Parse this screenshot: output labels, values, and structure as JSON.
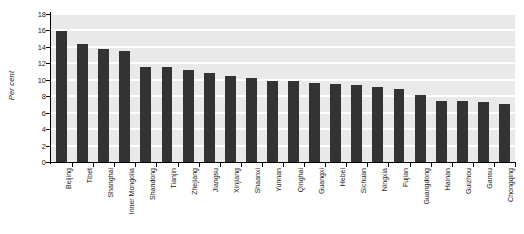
{
  "chart_data": {
    "type": "bar",
    "title": "",
    "xlabel": "",
    "ylabel": "Per cent",
    "ylim": [
      0,
      18
    ],
    "ytick_step": 2,
    "yticks": [
      0,
      2,
      4,
      6,
      8,
      10,
      12,
      14,
      16,
      18
    ],
    "grid": true,
    "legend": "none",
    "bar_color": "#333333",
    "plot_background": "#e9e9e9",
    "gridline_color": "#ffffff",
    "axis_color": "#000000",
    "categories": [
      "Beijing",
      "Tibet",
      "Shanghai",
      "Inner Mongolia",
      "Shandong",
      "Tianjin",
      "Zhejiang",
      "Jiangsu",
      "Xinjiang",
      "Shaanxi",
      "Yunnan",
      "Qinghai",
      "Guangxi",
      "Hebei",
      "Sichuan",
      "Ningxia",
      "Fujian",
      "Guangdong",
      "Hainan",
      "Guizhou",
      "Gansu",
      "Chongqing"
    ],
    "values": [
      15.9,
      14.3,
      13.7,
      13.5,
      11.6,
      11.5,
      11.2,
      10.8,
      10.5,
      10.2,
      9.9,
      9.8,
      9.6,
      9.5,
      9.4,
      9.1,
      8.9,
      8.1,
      7.4,
      7.4,
      7.3,
      7.1
    ]
  }
}
